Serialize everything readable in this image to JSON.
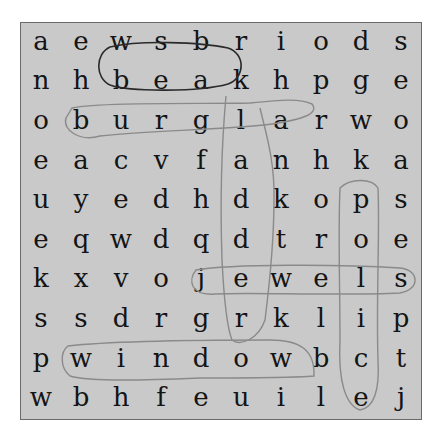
{
  "puzzle": {
    "rows": [
      [
        "a",
        "e",
        "w",
        "s",
        "b",
        "r",
        "i",
        "o",
        "d",
        "s"
      ],
      [
        "n",
        "h",
        "b",
        "e",
        "a",
        "k",
        "h",
        "p",
        "g",
        "e"
      ],
      [
        "o",
        "b",
        "u",
        "r",
        "g",
        "l",
        "a",
        "r",
        "w",
        "o"
      ],
      [
        "e",
        "a",
        "c",
        "v",
        "f",
        "a",
        "n",
        "h",
        "k",
        "a"
      ],
      [
        "u",
        "y",
        "e",
        "d",
        "h",
        "d",
        "k",
        "o",
        "p",
        "s"
      ],
      [
        "e",
        "q",
        "w",
        "d",
        "q",
        "d",
        "t",
        "r",
        "o",
        "e"
      ],
      [
        "k",
        "x",
        "v",
        "o",
        "j",
        "e",
        "w",
        "e",
        "l",
        "s"
      ],
      [
        "s",
        "s",
        "d",
        "r",
        "g",
        "r",
        "k",
        "l",
        "i",
        "p"
      ],
      [
        "p",
        "w",
        "i",
        "n",
        "d",
        "o",
        "w",
        "b",
        "c",
        "t"
      ],
      [
        "w",
        "b",
        "h",
        "f",
        "e",
        "u",
        "i",
        "l",
        "e",
        "j"
      ]
    ],
    "circled_words": [
      {
        "word": "beak",
        "direction": "horizontal",
        "row": 1,
        "start_col": 2,
        "end_col": 5,
        "ink": "#2a2a2a"
      },
      {
        "word": "burglar",
        "direction": "horizontal",
        "row": 2,
        "start_col": 1,
        "end_col": 7,
        "ink": "#8a8a8a"
      },
      {
        "word": "kaddder",
        "direction": "vertical",
        "col": 5,
        "start_row": 1,
        "end_row": 7,
        "ink": "#8a8a8a"
      },
      {
        "word": "jewels",
        "direction": "horizontal",
        "row": 6,
        "start_col": 4,
        "end_col": 9,
        "ink": "#8a8a8a"
      },
      {
        "word": "window",
        "direction": "horizontal",
        "row": 8,
        "start_col": 1,
        "end_col": 6,
        "ink": "#8a8a8a"
      },
      {
        "word": "police",
        "direction": "vertical",
        "col": 8,
        "start_row": 4,
        "end_row": 9,
        "ink": "#8a8a8a"
      }
    ],
    "colors": {
      "board_background": "#c9c9c9",
      "letter": "#141414",
      "dark_ink": "#2a2a2a",
      "light_ink": "#8a8a8a"
    }
  }
}
